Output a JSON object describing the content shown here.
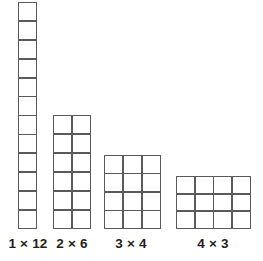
{
  "figure": {
    "background_color": "#ffffff",
    "grid_line_color": "#5a5a5a",
    "cell_fill_color": "#ffffff",
    "label_color": "#231f20"
  },
  "chart_data": {
    "type": "bar",
    "xlabel": "",
    "ylabel": "",
    "categories": [
      "1 × 12",
      "2 × 6",
      "3 × 4",
      "4 × 3"
    ],
    "values": [
      12,
      6,
      4,
      3
    ],
    "series": [
      {
        "name": "rows (height in cells)",
        "values": [
          12,
          6,
          4,
          3
        ]
      },
      {
        "name": "columns (width in cells)",
        "values": [
          1,
          2,
          3,
          4
        ]
      },
      {
        "name": "total cells (area)",
        "values": [
          12,
          12,
          12,
          12
        ]
      }
    ],
    "annotations": [
      "Each array contains 12 unit squares"
    ],
    "grid": true,
    "legend": "none"
  },
  "arrays": [
    {
      "id": "array-1x12",
      "label": "1 × 12",
      "columns": 1,
      "rows": 12,
      "total_cells": 12,
      "left": 18,
      "top": 2,
      "width": 19,
      "height": 227,
      "label_left": 2,
      "label_top": 236,
      "label_width": 52
    },
    {
      "id": "array-2x6",
      "label": "2 × 6",
      "columns": 2,
      "rows": 6,
      "total_cells": 12,
      "left": 53,
      "top": 115,
      "width": 38,
      "height": 114,
      "label_left": 46,
      "label_top": 236,
      "label_width": 52
    },
    {
      "id": "array-3x4",
      "label": "3 × 4",
      "columns": 3,
      "rows": 4,
      "total_cells": 12,
      "left": 104,
      "top": 155,
      "width": 57,
      "height": 74,
      "label_left": 105,
      "label_top": 236,
      "label_width": 52
    },
    {
      "id": "array-4x3",
      "label": "4 × 3",
      "columns": 4,
      "rows": 3,
      "total_cells": 12,
      "left": 176,
      "top": 176,
      "width": 75,
      "height": 53,
      "label_left": 187,
      "label_top": 236,
      "label_width": 52
    }
  ]
}
